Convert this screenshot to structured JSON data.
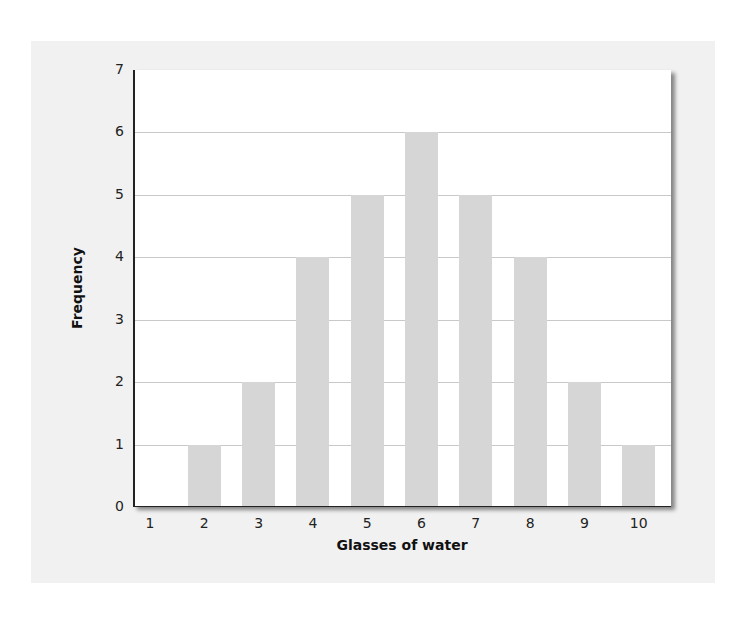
{
  "chart_data": {
    "type": "bar",
    "title": "",
    "xlabel": "Glasses of water",
    "ylabel": "Frequency",
    "categories": [
      "1",
      "2",
      "3",
      "4",
      "5",
      "6",
      "7",
      "8",
      "9",
      "10"
    ],
    "values": [
      0,
      1,
      2,
      4,
      5,
      6,
      5,
      4,
      2,
      1
    ],
    "ylim": [
      0,
      7
    ],
    "yticks": [
      "0",
      "1",
      "2",
      "3",
      "4",
      "5",
      "6",
      "7"
    ],
    "grid": true,
    "legend": null,
    "colors": {
      "bar": "#d6d6d6",
      "grid": "#c9c9c9",
      "panel": "#f1f1f1",
      "plot_bg": "#ffffff",
      "axis": "#222222"
    }
  }
}
